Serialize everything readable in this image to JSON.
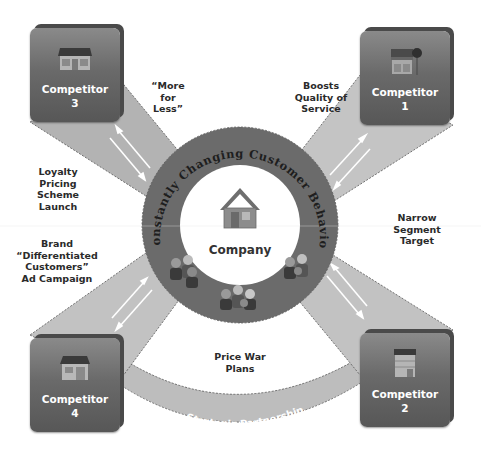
{
  "diagram": {
    "center": {
      "label": "Company",
      "icon": "house-icon"
    },
    "ring": {
      "text": "Constantly Changing Customer Behavior",
      "people_icons": [
        "people-group-icon",
        "people-group-icon",
        "people-group-icon"
      ]
    },
    "competitors": [
      {
        "id": "competitor-1",
        "label": "Competitor\n1",
        "icon": "storefront-icon",
        "position": "top-right"
      },
      {
        "id": "competitor-2",
        "label": "Competitor\n2",
        "icon": "office-building-icon",
        "position": "bottom-right"
      },
      {
        "id": "competitor-3",
        "label": "Competitor\n3",
        "icon": "shop-icon",
        "position": "top-left"
      },
      {
        "id": "competitor-4",
        "label": "Competitor\n4",
        "icon": "house-shop-icon",
        "position": "bottom-left"
      }
    ],
    "labels": {
      "more_for_less": "“More\nfor\nLess”",
      "boosts_quality": "Boosts\nQuality of\nService",
      "loyalty_pricing": "Loyalty\nPricing\nScheme\nLaunch",
      "narrow_segment": "Narrow\nSegment\nTarget",
      "brand_campaign": "Brand\n“Differentiated\nCustomers”\nAd Campaign",
      "price_war": "Price War\nPlans",
      "strategic_partnership": "Strategic Partnership"
    },
    "colors": {
      "ring": "#6b6b6b",
      "band": "#bdbdbd",
      "box_top": "#8a8a8a",
      "box_bottom": "#575757",
      "text_dark": "#2a2a2a",
      "text_light": "#ffffff"
    }
  }
}
